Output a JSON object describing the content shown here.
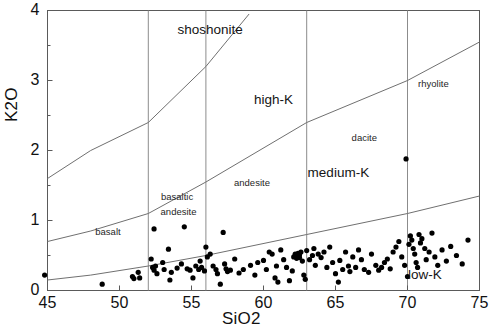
{
  "chart_data": {
    "type": "scatter",
    "title": "",
    "xlabel": "SiO2",
    "ylabel": "K2O",
    "xlim": [
      45,
      75
    ],
    "ylim": [
      0,
      4
    ],
    "xticks": [
      45,
      50,
      55,
      60,
      65,
      70,
      75
    ],
    "yticks": [
      0,
      1,
      2,
      3,
      4
    ],
    "yminorticks": [
      0.5,
      1.5,
      2.5,
      3.5
    ],
    "grid": false,
    "legend_position": "none",
    "marker": {
      "shape": "circle",
      "color": "#000000",
      "size": 4
    },
    "vertical_divider_lines": [
      52,
      56,
      63,
      70
    ],
    "series": [
      {
        "name": "samples",
        "x": [
          44.8,
          48.8,
          50.9,
          51.0,
          51.3,
          51.4,
          52.2,
          52.3,
          52.4,
          52.4,
          52.5,
          52.6,
          53.0,
          53.1,
          53.4,
          53.5,
          53.6,
          54.0,
          54.3,
          54.5,
          54.7,
          54.9,
          55.1,
          55.3,
          55.5,
          55.6,
          55.7,
          55.9,
          56.0,
          56.1,
          56.3,
          56.5,
          56.7,
          56.8,
          57.0,
          57.2,
          57.3,
          57.4,
          57.5,
          57.7,
          58.0,
          58.3,
          58.6,
          59.1,
          59.4,
          59.6,
          60.0,
          60.2,
          60.4,
          60.6,
          60.8,
          60.9,
          61.0,
          61.2,
          61.4,
          61.6,
          61.8,
          62.0,
          62.1,
          62.2,
          62.3,
          62.3,
          62.4,
          62.4,
          62.5,
          62.5,
          62.6,
          62.7,
          62.8,
          62.9,
          63.0,
          63.2,
          63.4,
          63.5,
          63.6,
          63.8,
          64.0,
          64.2,
          64.4,
          64.6,
          64.8,
          65.0,
          65.2,
          65.3,
          65.5,
          65.7,
          65.9,
          66.0,
          66.2,
          66.4,
          66.6,
          66.8,
          67.0,
          67.3,
          67.5,
          67.8,
          68.0,
          68.2,
          68.4,
          68.6,
          68.8,
          69.0,
          69.2,
          69.4,
          69.6,
          69.8,
          70.0,
          70.1,
          70.2,
          70.3,
          70.4,
          70.5,
          70.6,
          70.7,
          70.8,
          70.9,
          71.0,
          71.2,
          71.3,
          71.5,
          71.7,
          71.9,
          72.1,
          72.4,
          72.7,
          73.0,
          73.4,
          73.8,
          74.2,
          69.9
        ],
        "y": [
          0.22,
          0.09,
          0.2,
          0.17,
          0.26,
          0.18,
          0.45,
          0.33,
          0.29,
          0.88,
          0.35,
          0.24,
          0.4,
          0.3,
          0.59,
          0.15,
          0.26,
          0.32,
          0.38,
          0.91,
          0.31,
          0.29,
          0.18,
          0.35,
          0.3,
          0.42,
          0.33,
          0.28,
          0.62,
          0.48,
          0.52,
          0.35,
          0.3,
          0.24,
          0.09,
          0.83,
          0.38,
          0.31,
          0.27,
          0.29,
          0.45,
          0.25,
          0.3,
          0.36,
          0.22,
          0.4,
          0.43,
          0.3,
          0.55,
          0.52,
          0.18,
          0.35,
          0.12,
          0.58,
          0.44,
          0.33,
          0.14,
          0.28,
          0.48,
          0.52,
          0.46,
          0.5,
          0.49,
          0.53,
          0.47,
          0.51,
          0.55,
          0.42,
          0.22,
          0.16,
          0.57,
          0.44,
          0.5,
          0.6,
          0.36,
          0.52,
          0.47,
          0.55,
          0.33,
          0.62,
          0.4,
          0.24,
          0.12,
          0.43,
          0.3,
          0.55,
          0.35,
          0.27,
          0.48,
          0.33,
          0.58,
          0.44,
          0.3,
          0.26,
          0.52,
          0.36,
          0.29,
          0.33,
          0.4,
          0.45,
          0.31,
          0.55,
          0.62,
          0.7,
          0.48,
          0.36,
          0.2,
          0.66,
          0.78,
          0.72,
          0.6,
          0.52,
          0.4,
          0.33,
          0.8,
          0.68,
          0.74,
          0.6,
          0.44,
          0.55,
          0.82,
          0.48,
          0.36,
          0.58,
          0.42,
          0.63,
          0.5,
          0.38,
          0.72,
          1.88
        ]
      }
    ],
    "boundaries": [
      {
        "name": "low-medium-K",
        "style": "solid",
        "points": [
          [
            45,
            0.15
          ],
          [
            48,
            0.22
          ],
          [
            52,
            0.35
          ],
          [
            56,
            0.5
          ],
          [
            63,
            0.8
          ],
          [
            70,
            1.1
          ],
          [
            75,
            1.35
          ]
        ]
      },
      {
        "name": "medium-high-K",
        "style": "solid",
        "points": [
          [
            45,
            0.7
          ],
          [
            48,
            0.85
          ],
          [
            52,
            1.1
          ],
          [
            56,
            1.55
          ],
          [
            63,
            2.4
          ],
          [
            70,
            3.0
          ],
          [
            75,
            3.55
          ]
        ]
      },
      {
        "name": "high-K-shoshonite",
        "style": "solid",
        "points": [
          [
            45,
            1.6
          ],
          [
            48,
            2.0
          ],
          [
            52,
            2.4
          ],
          [
            56,
            3.2
          ],
          [
            59,
            3.95
          ]
        ]
      }
    ],
    "field_labels": [
      {
        "text": "shoshonite",
        "x": 56.3,
        "y": 3.72
      },
      {
        "text": "high-K",
        "x": 60.7,
        "y": 2.72
      },
      {
        "text": "medium-K",
        "x": 65.2,
        "y": 1.68
      },
      {
        "text": "low-K",
        "x": 71.2,
        "y": 0.22
      }
    ],
    "rock_labels": [
      {
        "text": "basalt",
        "x": 49.2,
        "y": 0.83
      },
      {
        "text": "basaltic",
        "x": 54.0,
        "y": 1.33
      },
      {
        "text": "andesite",
        "x": 54.1,
        "y": 1.12
      },
      {
        "text": "andesite",
        "x": 59.2,
        "y": 1.53
      },
      {
        "text": "dacite",
        "x": 67.0,
        "y": 2.18
      },
      {
        "text": "rhyolite",
        "x": 71.8,
        "y": 2.95
      }
    ]
  },
  "axis": {
    "xlabel": "SiO2",
    "ylabel": "K2O",
    "xticklabels": [
      "45",
      "50",
      "55",
      "60",
      "65",
      "70",
      "75"
    ],
    "yticklabels": [
      "0",
      "1",
      "2",
      "3",
      "4"
    ]
  },
  "colors": {
    "marker": "#000000",
    "boundary": "#707070",
    "divider": "#8c8c8c",
    "frame": "#5a5a5a",
    "text": "#111111"
  }
}
